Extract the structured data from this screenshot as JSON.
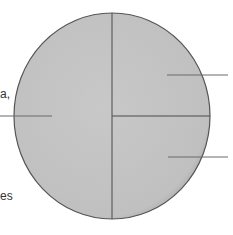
{
  "diagram": {
    "type": "pie-quadrants",
    "colors": {
      "fill": "#c4c4c4",
      "stroke": "#555555",
      "divider": "#4a4a4a",
      "leader": "#6a6a6a",
      "background": "#ffffff"
    },
    "segments": [
      {
        "name": "left-half",
        "fraction": 0.5
      },
      {
        "name": "upper-right-quarter",
        "fraction": 0.25
      },
      {
        "name": "lower-right-quarter",
        "fraction": 0.25
      }
    ],
    "labels": {
      "left_upper_fragment": "a,",
      "left_lower_fragment": "es"
    }
  }
}
